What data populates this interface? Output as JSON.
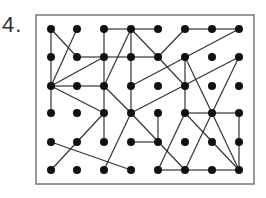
{
  "problem": {
    "number_label": "4.",
    "frame": {
      "x": 36,
      "y": 15,
      "width": 218,
      "height": 169,
      "stroke": "#777777"
    },
    "grid": {
      "columns_x": [
        51,
        77,
        104,
        131,
        158,
        185,
        212,
        239
      ],
      "rows_y": [
        29,
        57,
        86,
        113,
        142,
        170
      ],
      "dot_radius": 4,
      "dot_color": "#111111"
    },
    "line_color": "#333333",
    "edges": [
      [
        [
          0,
          0
        ],
        [
          0,
          1
        ]
      ],
      [
        [
          0,
          1
        ],
        [
          0,
          2
        ]
      ],
      [
        [
          0,
          2
        ],
        [
          0,
          3
        ]
      ],
      [
        [
          0,
          0
        ],
        [
          1,
          1
        ]
      ],
      [
        [
          1,
          0
        ],
        [
          0,
          2
        ]
      ],
      [
        [
          2,
          0
        ],
        [
          3,
          0
        ]
      ],
      [
        [
          2,
          0
        ],
        [
          2,
          1
        ]
      ],
      [
        [
          2,
          1
        ],
        [
          2,
          2
        ]
      ],
      [
        [
          2,
          2
        ],
        [
          2,
          3
        ]
      ],
      [
        [
          2,
          3
        ],
        [
          2,
          4
        ]
      ],
      [
        [
          3,
          0
        ],
        [
          2,
          2
        ]
      ],
      [
        [
          3,
          0
        ],
        [
          3,
          1
        ]
      ],
      [
        [
          3,
          0
        ],
        [
          4,
          0
        ]
      ],
      [
        [
          3,
          0
        ],
        [
          4,
          1
        ]
      ],
      [
        [
          1,
          1
        ],
        [
          2,
          1
        ]
      ],
      [
        [
          2,
          1
        ],
        [
          3,
          1
        ]
      ],
      [
        [
          3,
          1
        ],
        [
          4,
          1
        ]
      ],
      [
        [
          3,
          1
        ],
        [
          3,
          2
        ]
      ],
      [
        [
          3,
          2
        ],
        [
          3,
          3
        ]
      ],
      [
        [
          0,
          2
        ],
        [
          2,
          1
        ]
      ],
      [
        [
          0,
          2
        ],
        [
          1,
          2
        ]
      ],
      [
        [
          1,
          2
        ],
        [
          2,
          2
        ]
      ],
      [
        [
          0,
          2
        ],
        [
          2,
          3
        ]
      ],
      [
        [
          2,
          2
        ],
        [
          3,
          3
        ]
      ],
      [
        [
          4,
          1
        ],
        [
          5,
          0
        ]
      ],
      [
        [
          4,
          1
        ],
        [
          5,
          2
        ]
      ],
      [
        [
          5,
          0
        ],
        [
          6,
          0
        ]
      ],
      [
        [
          6,
          0
        ],
        [
          7,
          0
        ]
      ],
      [
        [
          7,
          0
        ],
        [
          3,
          2
        ]
      ],
      [
        [
          5,
          1
        ],
        [
          5,
          2
        ]
      ],
      [
        [
          5,
          2
        ],
        [
          5,
          3
        ]
      ],
      [
        [
          5,
          1
        ],
        [
          6,
          3
        ]
      ],
      [
        [
          7,
          1
        ],
        [
          3,
          3
        ]
      ],
      [
        [
          7,
          1
        ],
        [
          6,
          3
        ]
      ],
      [
        [
          5,
          3
        ],
        [
          6,
          3
        ]
      ],
      [
        [
          6,
          3
        ],
        [
          7,
          3
        ]
      ],
      [
        [
          2,
          3
        ],
        [
          1,
          4
        ]
      ],
      [
        [
          1,
          4
        ],
        [
          0,
          5
        ]
      ],
      [
        [
          3,
          3
        ],
        [
          2,
          5
        ]
      ],
      [
        [
          3,
          3
        ],
        [
          5,
          5
        ]
      ],
      [
        [
          0,
          4
        ],
        [
          3,
          5
        ]
      ],
      [
        [
          3,
          4
        ],
        [
          4,
          4
        ]
      ],
      [
        [
          4,
          3
        ],
        [
          4,
          4
        ]
      ],
      [
        [
          5,
          3
        ],
        [
          4,
          5
        ]
      ],
      [
        [
          5,
          3
        ],
        [
          7,
          5
        ]
      ],
      [
        [
          6,
          3
        ],
        [
          5,
          5
        ]
      ],
      [
        [
          6,
          3
        ],
        [
          7,
          5
        ]
      ],
      [
        [
          7,
          3
        ],
        [
          7,
          4
        ]
      ],
      [
        [
          7,
          4
        ],
        [
          7,
          5
        ]
      ],
      [
        [
          4,
          5
        ],
        [
          5,
          5
        ]
      ],
      [
        [
          5,
          5
        ],
        [
          6,
          5
        ]
      ],
      [
        [
          6,
          5
        ],
        [
          7,
          5
        ]
      ]
    ]
  }
}
